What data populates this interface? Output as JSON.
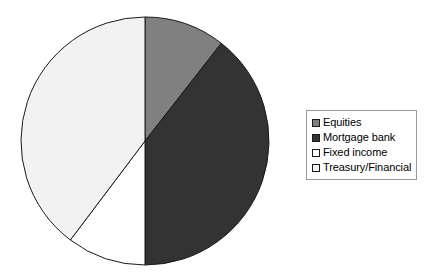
{
  "chart_data": {
    "type": "pie",
    "title": "",
    "subtitle": "",
    "xlabel": "",
    "ylabel": "",
    "grid": false,
    "legend_position": "right",
    "start_angle_deg": 0,
    "direction": "clockwise",
    "center": {
      "x": 145,
      "y": 141
    },
    "radius": 124,
    "categories": [
      "Equities",
      "Mortgage bank",
      "Fixed income",
      "Treasury/Financial"
    ],
    "values": [
      10.5,
      39.5,
      10.2,
      39.8
    ],
    "angles_deg": [
      38,
      142,
      37,
      143
    ],
    "colors": [
      "#808080",
      "#333333",
      "#ffffff",
      "#f2f2f2"
    ],
    "slice_border_color": "#1a1a1a",
    "slices": [
      {
        "label": "Equities",
        "value": 10.5,
        "angle_deg": 38,
        "color": "#808080",
        "start_deg": 0,
        "end_deg": 38
      },
      {
        "label": "Mortgage bank",
        "value": 39.5,
        "angle_deg": 142,
        "color": "#333333",
        "start_deg": 38,
        "end_deg": 180
      },
      {
        "label": "Fixed income",
        "value": 10.2,
        "angle_deg": 37,
        "color": "#ffffff",
        "start_deg": 180,
        "end_deg": 217
      },
      {
        "label": "Treasury/Financial",
        "value": 39.8,
        "angle_deg": 143,
        "color": "#f2f2f2",
        "start_deg": 217,
        "end_deg": 360
      }
    ]
  },
  "legend": {
    "border_color": "#999999",
    "background": "#ffffff",
    "items": [
      {
        "label": "Equities",
        "color": "#808080",
        "swatch": "legend-swatch-icon"
      },
      {
        "label": "Mortgage bank",
        "color": "#333333",
        "swatch": "legend-swatch-icon"
      },
      {
        "label": "Fixed income",
        "color": "#ffffff",
        "swatch": "legend-swatch-icon"
      },
      {
        "label": "Treasury/Financial",
        "color": "#f2f2f2",
        "swatch": "legend-swatch-icon"
      }
    ]
  },
  "canvas": {
    "background": "#ffffff",
    "width": 425,
    "height": 275
  }
}
